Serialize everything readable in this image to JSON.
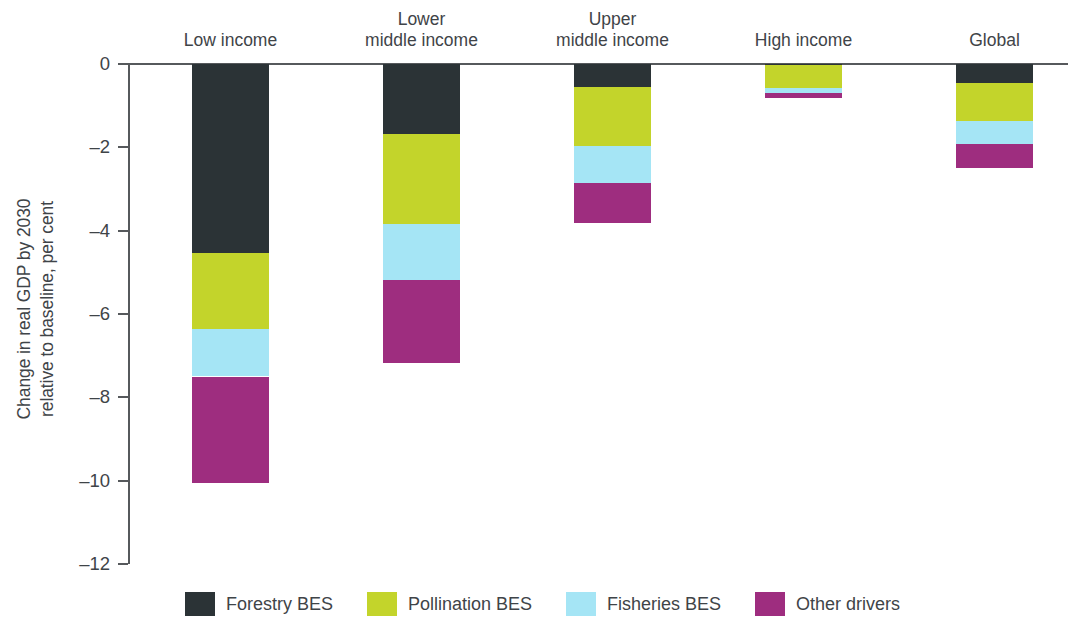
{
  "chart_data": {
    "type": "bar",
    "subtype": "stacked-bar",
    "title": "",
    "xlabel": "",
    "ylabel": "Change in real GDP by 2030\nrelative to baseline, per cent",
    "ylim": [
      -12,
      0
    ],
    "yticks": [
      0,
      -2,
      -4,
      -6,
      -8,
      -10,
      -12
    ],
    "ytick_labels": [
      "0",
      "–2",
      "–4",
      "–6",
      "–8",
      "–10",
      "–12"
    ],
    "grid": false,
    "legend_position": "bottom",
    "categories": [
      "Low income",
      "Lower\nmiddle income",
      "Upper\nmiddle income",
      "High income",
      "Global"
    ],
    "series": [
      {
        "name": "Forestry BES",
        "color": "#2b3336",
        "values": [
          -4.53,
          -1.68,
          -0.56,
          -0.02,
          -0.45
        ]
      },
      {
        "name": "Pollination BES",
        "color": "#c3d42b",
        "values": [
          -1.84,
          -2.17,
          -1.41,
          -0.55,
          -0.91
        ]
      },
      {
        "name": "Fisheries BES",
        "color": "#a5e5f5",
        "values": [
          -1.13,
          -1.33,
          -0.89,
          -0.12,
          -0.56
        ]
      },
      {
        "name": "Other drivers",
        "color": "#9e2d7f",
        "values": [
          -2.55,
          -2.0,
          -0.95,
          -0.13,
          -0.58
        ]
      }
    ],
    "totals": [
      -10.05,
      -7.18,
      -3.81,
      -0.82,
      -2.5
    ]
  },
  "legend": {
    "items": [
      {
        "label": "Forestry BES",
        "color": "#2b3336"
      },
      {
        "label": "Pollination BES",
        "color": "#c3d42b"
      },
      {
        "label": "Fisheries BES",
        "color": "#a5e5f5"
      },
      {
        "label": "Other drivers",
        "color": "#9e2d7f"
      }
    ]
  },
  "axis": {
    "y_title": "Change in real GDP by 2030\nrelative to baseline, per cent",
    "ticks": [
      "0",
      "–2",
      "–4",
      "–6",
      "–8",
      "–10",
      "–12"
    ]
  },
  "colors": {
    "forestry": "#2b3336",
    "pollination": "#c3d42b",
    "fisheries": "#a5e5f5",
    "other": "#9e2d7f",
    "axis": "#56595c",
    "text": "#3f4448",
    "background": "#ffffff"
  }
}
